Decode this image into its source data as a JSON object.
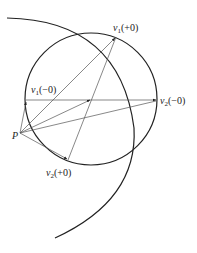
{
  "diagram": {
    "type": "geometric-construction",
    "colors": {
      "stroke": "#222222",
      "thin": "#555555",
      "background": "#ffffff"
    },
    "labels": {
      "p": {
        "text": "P"
      },
      "v1_plus": {
        "var": "v",
        "sub": "1",
        "suffix": "(+0)"
      },
      "v1_minus": {
        "var": "v",
        "sub": "1",
        "suffix": "(−0)"
      },
      "v2_minus": {
        "var": "v",
        "sub": "2",
        "suffix": "(−0)"
      },
      "v2_plus": {
        "var": "v",
        "sub": "2",
        "suffix": "(+0)"
      }
    },
    "circle": {
      "cx": 91,
      "cy": 99,
      "r": 66
    },
    "large_arc": {
      "from": [
        7,
        18
      ],
      "to": [
        55,
        238
      ],
      "center": [
        22,
        128
      ],
      "r": 112
    },
    "points": {
      "P": [
        20,
        133
      ],
      "v1_plus": [
        116,
        37
      ],
      "v1_minus": [
        26,
        100
      ],
      "v2_minus": [
        157,
        100
      ],
      "v2_plus": [
        68,
        160
      ],
      "center": [
        91,
        99
      ]
    }
  }
}
